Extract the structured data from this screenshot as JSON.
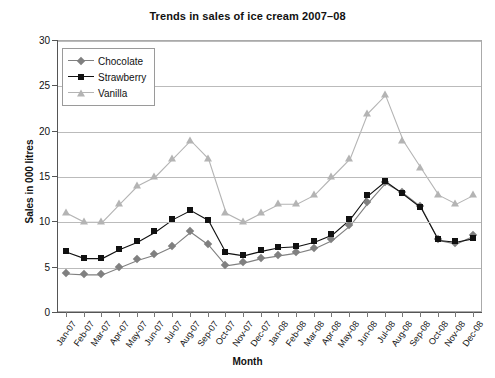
{
  "chart_data": {
    "type": "line",
    "title": "Trends in sales of ice cream 2007–08",
    "xlabel": "Month",
    "ylabel": "Sales in 000 litres",
    "ylim": [
      0,
      30
    ],
    "ytick_step": 5,
    "yticks": [
      "0",
      "5",
      "10",
      "15",
      "20",
      "25",
      "30"
    ],
    "grid": true,
    "legend_position": "top-left-inside",
    "categories": [
      "Jan-07",
      "Feb-07",
      "Mar-07",
      "Apr-07",
      "May-07",
      "Jun-07",
      "Jul-07",
      "Aug-07",
      "Sep-07",
      "Oct-07",
      "Nov-07",
      "Dec-07",
      "Jan-08",
      "Feb-08",
      "Mar-08",
      "Apr-08",
      "May-08",
      "Jun-08",
      "Jul-08",
      "Aug-08",
      "Sep-08",
      "Oct-08",
      "Nov-08",
      "Dec-08"
    ],
    "series": [
      {
        "name": "Chocolate",
        "color": "#808080",
        "marker": "diamond",
        "values": [
          4.3,
          4.2,
          4.2,
          5.0,
          5.8,
          6.4,
          7.3,
          8.9,
          7.5,
          5.2,
          5.5,
          6.0,
          6.3,
          6.6,
          7.1,
          8.0,
          9.6,
          12.1,
          14.3,
          13.2,
          11.7,
          8.0,
          7.6,
          8.5
        ]
      },
      {
        "name": "Strawberry",
        "color": "#111111",
        "marker": "square",
        "values": [
          6.7,
          6.0,
          6.0,
          7.0,
          7.8,
          8.9,
          10.3,
          11.3,
          10.2,
          6.6,
          6.3,
          6.8,
          7.2,
          7.3,
          7.8,
          8.6,
          10.3,
          12.9,
          14.5,
          13.1,
          11.6,
          8.0,
          7.8,
          8.2
        ]
      },
      {
        "name": "Vanilla",
        "color": "#b4b4b4",
        "marker": "triangle",
        "values": [
          11,
          10,
          10,
          12,
          14,
          15,
          17,
          19,
          17,
          11,
          10,
          11,
          12,
          12,
          13,
          15,
          17,
          22,
          24,
          19,
          16,
          13,
          12,
          13
        ]
      }
    ]
  }
}
